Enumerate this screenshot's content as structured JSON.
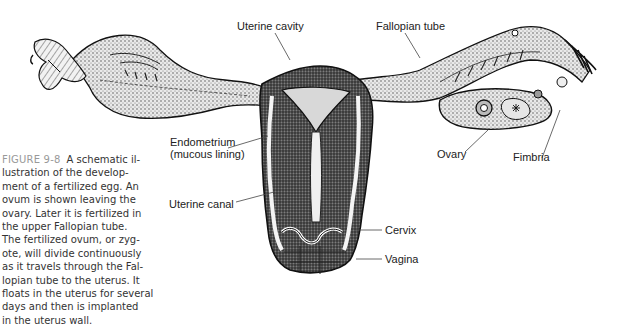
{
  "figure": {
    "number": "FIGURE 9-8",
    "caption_lines": [
      "A schematic il-",
      "lustration of the develop-",
      "ment of a fertilized egg. An",
      "ovum is shown leaving the",
      "ovary. Later it is fertilized in",
      "the upper Fallopian tube.",
      "The fertilized ovum, or zyg-",
      "ote, will divide continuously",
      "as it travels through the Fal-",
      "lopian tube to the uterus. It",
      "floats in the uterus for several",
      "days and then is implanted",
      "in the uterus wall."
    ],
    "illustration": "Cross-section of the female reproductive system: uterus, Fallopian tubes, ovaries",
    "labels": {
      "uterine_cavity": "Uterine cavity",
      "fallopian_tube": "Fallopian tube",
      "endometrium_1": "Endometrium",
      "endometrium_2": "(mucous lining)",
      "ovary": "Ovary",
      "fimbria": "Fimbria",
      "uterine_canal": "Uterine canal",
      "cervix": "Cervix",
      "vagina": "Vagina"
    },
    "colors": {
      "ink": "#1a1a1a",
      "caption_text": "#333333",
      "figure_number": "#999999",
      "background": "#ffffff"
    }
  }
}
